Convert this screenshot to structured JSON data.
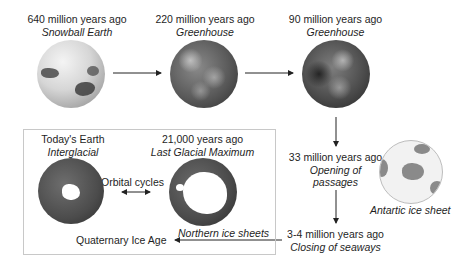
{
  "stages": [
    {
      "time": "640 million years ago",
      "name": "Snowball Earth",
      "globe": "snowball-earth-globe"
    },
    {
      "time": "220 million years ago",
      "name": "Greenhouse",
      "globe": "greenhouse-220-globe"
    },
    {
      "time": "90 million years ago",
      "name": "Greenhouse",
      "globe": "greenhouse-90-globe"
    },
    {
      "time": "33 million years ago",
      "name": "Opening of passages",
      "name_line1": "Opening of",
      "name_line2": "passages"
    },
    {
      "time": "3-4 million years ago",
      "name": "Closing of seaways"
    },
    {
      "time": "21,000 years ago",
      "name": "Last Glacial Maximum",
      "globe": "last-glacial-maximum-globe"
    },
    {
      "time": "Today's Earth",
      "name": "Interglacial",
      "globe": "today-earth-globe"
    }
  ],
  "annotations": {
    "antarctic": "Antartic ice sheet",
    "orbital": "Orbital cycles",
    "northern": "Northern ice sheets",
    "quaternary": "Quaternary Ice Age"
  },
  "colors": {
    "text": "#1e1e1e",
    "arrow": "#222222",
    "box_border": "#c8c8c8",
    "antarctic_land": "#8a8a8a",
    "antarctic_ocean": "#f2f2f2"
  }
}
